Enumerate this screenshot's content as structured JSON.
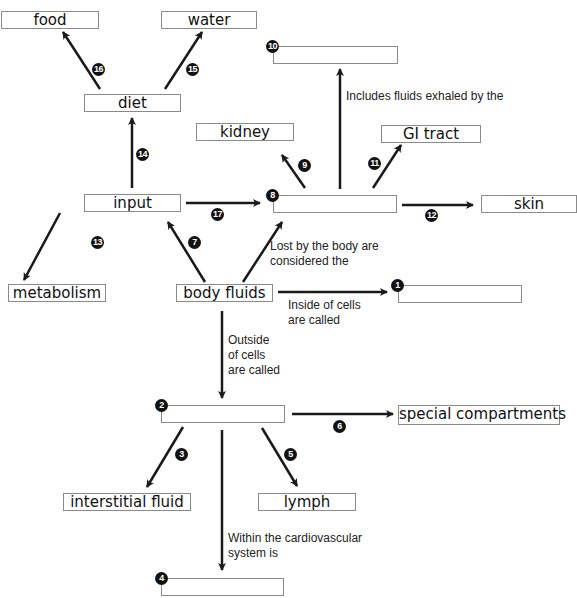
{
  "diagram": {
    "boxes": {
      "food": {
        "label": "food"
      },
      "water": {
        "label": "water"
      },
      "diet": {
        "label": "diet"
      },
      "kidney": {
        "label": "kidney"
      },
      "gi_tract": {
        "label": "GI tract"
      },
      "input": {
        "label": "input"
      },
      "skin": {
        "label": "skin"
      },
      "metabolism": {
        "label": "metabolism"
      },
      "body_fluids": {
        "label": "body fluids"
      },
      "special_compartments": {
        "label": "special compartments"
      },
      "interstitial_fluid": {
        "label": "interstitial fluid"
      },
      "lymph": {
        "label": "lymph"
      },
      "blank_1": {
        "label": ""
      },
      "blank_2": {
        "label": ""
      },
      "blank_4": {
        "label": ""
      },
      "blank_8": {
        "label": ""
      },
      "blank_10": {
        "label": ""
      }
    },
    "badges": {
      "b1": "1",
      "b2": "2",
      "b3": "3",
      "b4": "4",
      "b5": "5",
      "b6": "6",
      "b7": "7",
      "b8": "8",
      "b9": "9",
      "b10": "10",
      "b11": "11",
      "b12": "12",
      "b13": "13",
      "b14": "14",
      "b15": "15",
      "b16": "16",
      "b17": "17"
    },
    "notes": {
      "exhaled": "Includes fluids exhaled by the",
      "lost": "Lost by the body are\nconsidered the",
      "inside": "Inside of cells\nare called",
      "outside": "Outside\nof cells\nare called",
      "cardio": "Within the cardiovascular\nsystem is"
    },
    "colors": {
      "line": "#1a1a1a",
      "box_border": "#8a8a8a"
    }
  }
}
